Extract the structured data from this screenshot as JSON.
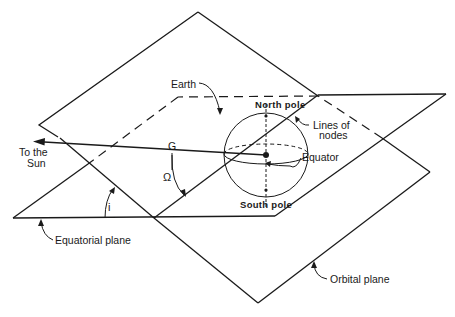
{
  "diagram": {
    "labels": {
      "earth": "Earth",
      "north_pole": "North pole",
      "south_pole": "South pole",
      "lines_of_nodes_1": "Lines of",
      "lines_of_nodes_2": "nodes",
      "equator": "Equator",
      "to_sun_1": "To the",
      "to_sun_2": "Sun",
      "g": "G",
      "omega": "Ω",
      "inclination": "i",
      "equatorial_plane": "Equatorial plane",
      "orbital_plane": "Orbital plane"
    },
    "colors": {
      "ink": "#1a1a1a",
      "background": "#ffffff"
    }
  }
}
